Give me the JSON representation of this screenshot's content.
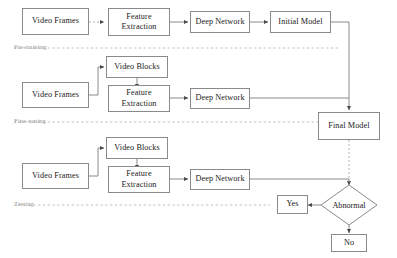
{
  "diagram": {
    "phases": [
      {
        "id": "pre-training",
        "label": "Pre-training"
      },
      {
        "id": "fine-tuning",
        "label": "Fine-tuning"
      },
      {
        "id": "testing",
        "label": "Testing"
      }
    ],
    "nodes": [
      {
        "id": "video-frames-1",
        "label": "Video Frames",
        "shape": "rect"
      },
      {
        "id": "feature-extraction-1",
        "label": "Feature Extraction",
        "shape": "rect"
      },
      {
        "id": "deep-network-1",
        "label": "Deep Network",
        "shape": "rect"
      },
      {
        "id": "initial-model",
        "label": "Initial Model",
        "shape": "rect"
      },
      {
        "id": "video-blocks-1",
        "label": "Video Blocks",
        "shape": "rect"
      },
      {
        "id": "video-frames-2",
        "label": "Video Frames",
        "shape": "rect"
      },
      {
        "id": "feature-extraction-2",
        "label": "Feature Extraction",
        "shape": "rect"
      },
      {
        "id": "deep-network-2",
        "label": "Deep Network",
        "shape": "rect"
      },
      {
        "id": "final-model",
        "label": "Final Model",
        "shape": "rect"
      },
      {
        "id": "video-blocks-2",
        "label": "Video Blocks",
        "shape": "rect"
      },
      {
        "id": "video-frames-3",
        "label": "Video Frames",
        "shape": "rect"
      },
      {
        "id": "feature-extraction-3",
        "label": "Feature Extraction",
        "shape": "rect"
      },
      {
        "id": "deep-network-3",
        "label": "Deep Network",
        "shape": "rect"
      },
      {
        "id": "abnormal-decision",
        "label": "Abnormal",
        "shape": "diamond"
      },
      {
        "id": "yes-outcome",
        "label": "Yes",
        "shape": "rect"
      },
      {
        "id": "no-outcome",
        "label": "No",
        "shape": "rect"
      }
    ],
    "labels": {
      "video_frames": "Video Frames",
      "feature_extraction_line1": "Feature",
      "feature_extraction_line2": "Extraction",
      "deep_network": "Deep Network",
      "initial_model": "Initial Model",
      "video_blocks": "Video Blocks",
      "final_model": "Final Model",
      "abnormal": "Abnormal",
      "yes": "Yes",
      "no": "No",
      "pre_training": "Pre-training",
      "fine_tuning": "Fine-tuning",
      "testing": "Testing"
    },
    "colors": {
      "box_border": "#8a8a8a",
      "box_fill": "#ffffff",
      "text": "#1a1a1a",
      "wire": "#8a8a8a",
      "separator": "#b9b9b9",
      "phase_text": "#9a9a9a",
      "background": "#ffffff"
    }
  }
}
